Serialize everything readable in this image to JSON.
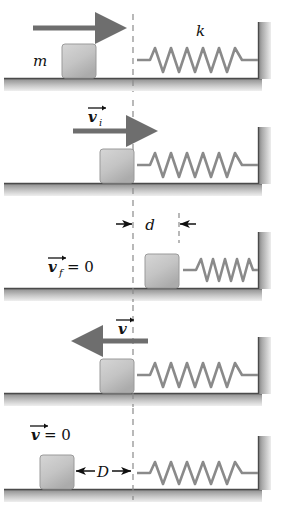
{
  "figure": {
    "panel_count": 5,
    "colors": {
      "block_fill": "#c6c6c6",
      "block_stroke": "#8f8f8f",
      "ground": "#9a9a9a",
      "wall": "#9a9a9a",
      "spring": "#8a8a8a",
      "arrow": "#6e6e6e",
      "dimension_arrow": "#1a1a1a",
      "dashed_line": "#808080",
      "label_text": "#111111",
      "background": "#ffffff"
    }
  },
  "panels": [
    {
      "id": "panel-1",
      "index": 1,
      "mass_label": "m",
      "spring_constant_label": "k",
      "velocity_label": "",
      "motion_arrow": "right",
      "spring_state": "relaxed",
      "block_x": 62,
      "description": "Block of mass m moving right toward relaxed spring of constant k"
    },
    {
      "id": "panel-2",
      "index": 2,
      "velocity_label": "v",
      "velocity_subscript": "i",
      "velocity_value": "",
      "motion_arrow": "right",
      "spring_state": "relaxed",
      "block_x": 103,
      "description": "Block arrives at free end of spring with initial velocity v-sub-i"
    },
    {
      "id": "panel-3",
      "index": 3,
      "velocity_label": "v",
      "velocity_subscript": "f",
      "velocity_value": "= 0",
      "distance_label": "d",
      "motion_arrow": "none",
      "spring_state": "compressed",
      "block_x": 145,
      "description": "Block momentarily at rest, spring compressed by distance d"
    },
    {
      "id": "panel-4",
      "index": 4,
      "velocity_label": "v",
      "velocity_subscript": "",
      "velocity_value": "",
      "motion_arrow": "left",
      "spring_state": "relaxed",
      "block_x": 103,
      "description": "Spring pushes block back to the left with velocity v"
    },
    {
      "id": "panel-5",
      "index": 5,
      "velocity_label": "v",
      "velocity_subscript": "",
      "velocity_value": "= 0",
      "distance_label": "D",
      "motion_arrow": "none",
      "spring_state": "relaxed",
      "block_x": 40,
      "description": "Block comes to rest a distance D from the spring's free end"
    }
  ],
  "labels": {
    "mass": "m",
    "spring_constant": "k",
    "v_initial": "v",
    "v_initial_sub": "i",
    "v_final": "v",
    "v_final_sub": "f",
    "v_final_value": "= 0",
    "v_return": "v",
    "v_rest": "v",
    "v_rest_value": "= 0",
    "compression_distance": "d",
    "slide_distance": "D",
    "equals_zero": "= 0"
  }
}
